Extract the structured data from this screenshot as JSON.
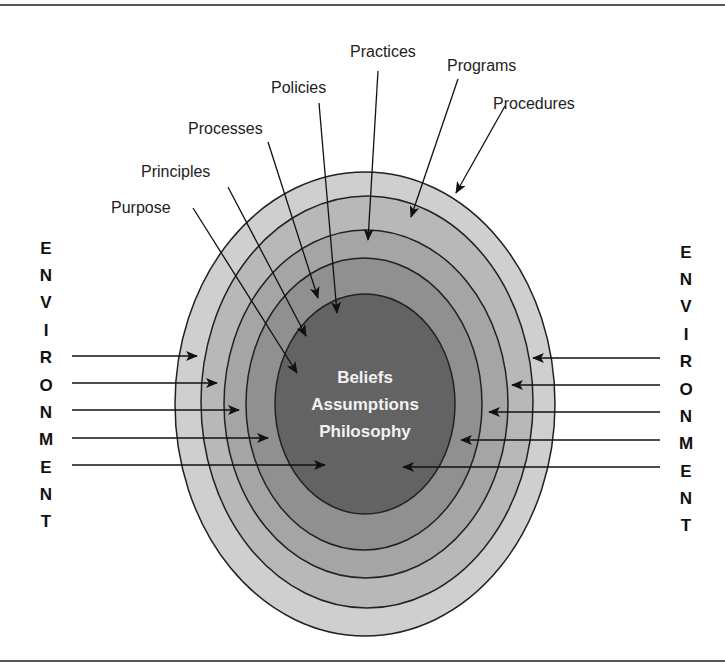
{
  "diagram": {
    "core_text": [
      "Beliefs",
      "Assumptions",
      "Philosophy"
    ],
    "layers_outer_to_inner": [
      "Procedures",
      "Programs",
      "Practices",
      "Policies",
      "Processes",
      "Principles",
      "Purpose"
    ],
    "labels": [
      {
        "text": "Practices",
        "x": 350,
        "y": 57
      },
      {
        "text": "Programs",
        "x": 447,
        "y": 71
      },
      {
        "text": "Policies",
        "x": 271,
        "y": 93
      },
      {
        "text": "Procedures",
        "x": 493,
        "y": 109
      },
      {
        "text": "Processes",
        "x": 188,
        "y": 134
      },
      {
        "text": "Principles",
        "x": 141,
        "y": 177
      },
      {
        "text": "Purpose",
        "x": 111,
        "y": 213
      }
    ],
    "environment_label": "ENVIRONMENT",
    "environment_letters": [
      "E",
      "N",
      "V",
      "I",
      "R",
      "O",
      "N",
      "M",
      "E",
      "N",
      "T"
    ],
    "colors": {
      "ring1": "#cfcfcf",
      "ring2": "#b5b5b5",
      "ring3": "#a3a3a3",
      "ring4": "#8f8f8f",
      "core": "#626262",
      "stroke": "#222222",
      "rule": "#555555"
    }
  }
}
